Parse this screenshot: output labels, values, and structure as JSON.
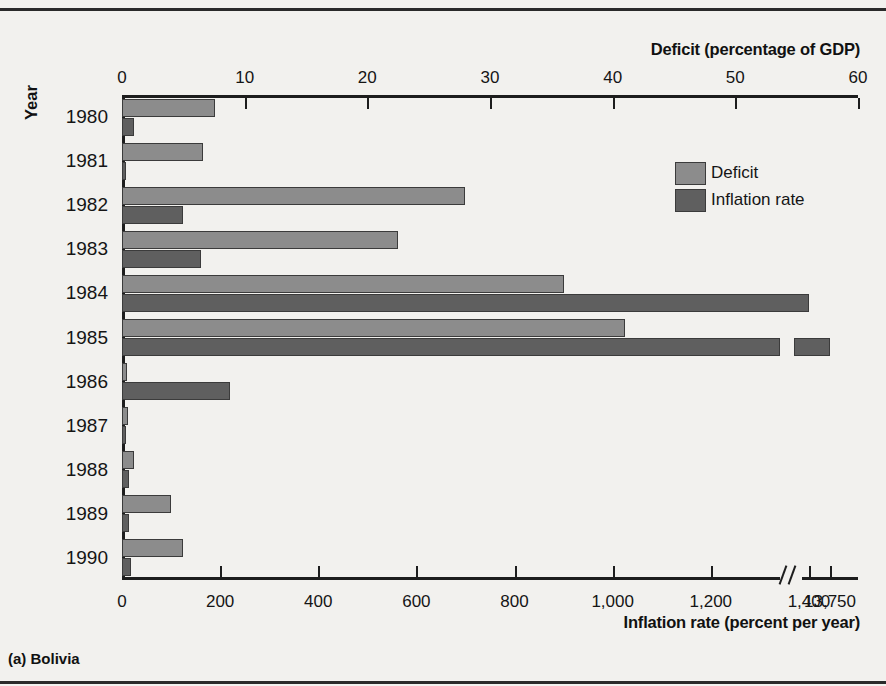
{
  "figure": {
    "caption": "(a) Bolivia",
    "y_axis_title": "Year",
    "top_axis_title": "Deficit (percentage of GDP)",
    "bottom_axis_title": "Inflation rate (percent per year)"
  },
  "legend": {
    "position": "inside-top-right",
    "items": [
      {
        "label": "Deficit",
        "color": "#8c8c8c",
        "swatch": "deficit-swatch"
      },
      {
        "label": "Inflation rate",
        "color": "#5f5f5f",
        "swatch": "inflation-swatch"
      }
    ]
  },
  "axes": {
    "top": {
      "title": "Deficit (percentage of GDP)",
      "ticks": [
        0,
        10,
        20,
        30,
        40,
        50,
        60
      ],
      "tick_labels": [
        "0",
        "10",
        "20",
        "30",
        "40",
        "50",
        "60"
      ],
      "range": [
        0,
        60
      ],
      "unit": "percentage of GDP"
    },
    "bottom": {
      "title": "Inflation rate (percent per year)",
      "ticks": [
        0,
        200,
        400,
        600,
        800,
        1000,
        1200,
        1400,
        13750
      ],
      "tick_labels": [
        "0",
        "200",
        "400",
        "600",
        "800",
        "1,000",
        "1,200",
        "1,400",
        "13,750"
      ],
      "range": [
        0,
        1500
      ],
      "has_break": true,
      "break_after": 1400,
      "unit": "percent per year"
    },
    "left": {
      "title": "Year",
      "categories": [
        "1980",
        "1981",
        "1982",
        "1983",
        "1984",
        "1985",
        "1986",
        "1987",
        "1988",
        "1989",
        "1990"
      ]
    }
  },
  "chart_data": {
    "type": "bar",
    "orientation": "horizontal",
    "title": "(a) Bolivia",
    "xlabel": "Deficit (percentage of GDP) / Inflation rate (percent per year)",
    "ylabel": "Year",
    "categories": [
      "1980",
      "1981",
      "1982",
      "1983",
      "1984",
      "1985",
      "1986",
      "1987",
      "1988",
      "1989",
      "1990"
    ],
    "grid": false,
    "legend_position": "inside-top-right",
    "series": [
      {
        "name": "Deficit",
        "unit": "percentage of GDP",
        "axis": "top",
        "color": "#8c8c8c",
        "values": [
          7.6,
          6.6,
          28.0,
          22.5,
          36.0,
          41.0,
          0.4,
          0.5,
          1.0,
          4.0,
          5.0
        ]
      },
      {
        "name": "Inflation rate",
        "unit": "percent per year",
        "axis": "bottom",
        "color": "#5f5f5f",
        "values": [
          25,
          8,
          125,
          160,
          1400,
          13750,
          220,
          8,
          15,
          15,
          18
        ]
      }
    ]
  },
  "bars": [
    {
      "year": "1980",
      "deficit_pct": 7.6,
      "inflation": 25,
      "deficit_frac": 0.1267,
      "inflation_frac": 0.0167,
      "broken": false
    },
    {
      "year": "1981",
      "deficit_pct": 6.6,
      "inflation": 8,
      "deficit_frac": 0.11,
      "inflation_frac": 0.0053,
      "broken": false
    },
    {
      "year": "1982",
      "deficit_pct": 28.0,
      "inflation": 125,
      "deficit_frac": 0.4667,
      "inflation_frac": 0.0833,
      "broken": false
    },
    {
      "year": "1983",
      "deficit_pct": 22.5,
      "inflation": 160,
      "deficit_frac": 0.375,
      "inflation_frac": 0.1067,
      "broken": false
    },
    {
      "year": "1984",
      "deficit_pct": 36.0,
      "inflation": 1400,
      "deficit_frac": 0.6,
      "inflation_frac": 0.9333,
      "broken": false
    },
    {
      "year": "1985",
      "deficit_pct": 41.0,
      "inflation": 13750,
      "deficit_frac": 0.6833,
      "inflation_frac": 1.0,
      "broken": true
    },
    {
      "year": "1986",
      "deficit_pct": 0.4,
      "inflation": 220,
      "deficit_frac": 0.0067,
      "inflation_frac": 0.1467,
      "broken": false
    },
    {
      "year": "1987",
      "deficit_pct": 0.5,
      "inflation": 8,
      "deficit_frac": 0.0083,
      "inflation_frac": 0.0053,
      "broken": false
    },
    {
      "year": "1988",
      "deficit_pct": 1.0,
      "inflation": 15,
      "deficit_frac": 0.0167,
      "inflation_frac": 0.01,
      "broken": false
    },
    {
      "year": "1989",
      "deficit_pct": 4.0,
      "inflation": 15,
      "deficit_frac": 0.0667,
      "inflation_frac": 0.01,
      "broken": false
    },
    {
      "year": "1990",
      "deficit_pct": 5.0,
      "inflation": 18,
      "deficit_frac": 0.0833,
      "inflation_frac": 0.012,
      "broken": false
    }
  ]
}
